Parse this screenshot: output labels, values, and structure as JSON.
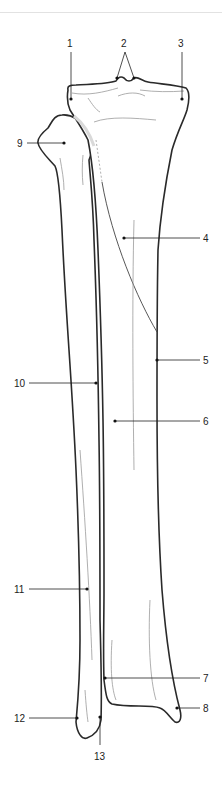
{
  "diagram": {
    "labels": [
      {
        "id": "1",
        "text": "1",
        "x": 71,
        "y": 47
      },
      {
        "id": "2",
        "text": "2",
        "x": 125,
        "y": 47
      },
      {
        "id": "3",
        "text": "3",
        "x": 182,
        "y": 47
      },
      {
        "id": "4",
        "text": "4",
        "x": 205,
        "y": 242
      },
      {
        "id": "5",
        "text": "5",
        "x": 205,
        "y": 363
      },
      {
        "id": "6",
        "text": "6",
        "x": 205,
        "y": 426
      },
      {
        "id": "7",
        "text": "7",
        "x": 205,
        "y": 682
      },
      {
        "id": "8",
        "text": "8",
        "x": 205,
        "y": 712
      },
      {
        "id": "9",
        "text": "9",
        "x": 18,
        "y": 149
      },
      {
        "id": "10",
        "text": "10",
        "x": 14,
        "y": 386
      },
      {
        "id": "11",
        "text": "11",
        "x": 14,
        "y": 592
      },
      {
        "id": "12",
        "text": "12",
        "x": 14,
        "y": 724
      },
      {
        "id": "13",
        "text": "13",
        "x": 95,
        "y": 762
      }
    ]
  },
  "colors": {
    "outline": "#2a2a2a",
    "detail": "#9a9a9a",
    "background": "#ffffff",
    "divider": "#e2e2e2"
  }
}
